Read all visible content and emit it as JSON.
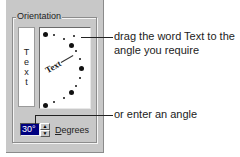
{
  "dialog": {
    "group_label": "Orientation",
    "vertical_text_letters": [
      "T",
      "e",
      "x",
      "t"
    ],
    "dial_text": "Text",
    "angle_value": "30°",
    "spin_up_icon": "triangle-up",
    "spin_down_icon": "triangle-down",
    "degrees_label": "Degrees",
    "degrees_mnemonic": "D",
    "degrees_rest": "egrees"
  },
  "annotations": {
    "drag_text_line1": "drag the word Text to the",
    "drag_text_line2": "angle you require",
    "enter_angle": "or enter an angle"
  },
  "colors": {
    "dialog_bg": "#c8c8c8",
    "selection_bg": "#000080",
    "selection_fg": "#ffffff"
  }
}
